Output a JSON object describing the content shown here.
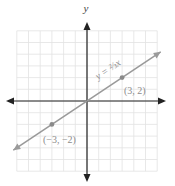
{
  "chart_data": {
    "type": "line",
    "title": "",
    "xlabel": "x",
    "ylabel": "y",
    "xlim": [
      -6,
      6
    ],
    "ylim": [
      -6,
      6
    ],
    "grid": true,
    "series": [
      {
        "name": "y = (2/3)x",
        "equation": "y = 2/3 x",
        "slope": 0.6667,
        "intercept": 0,
        "x": [
          -6,
          6
        ],
        "y": [
          -4,
          4
        ]
      }
    ],
    "points": [
      {
        "x": 3,
        "y": 2,
        "label": "(3, 2)"
      },
      {
        "x": -3,
        "y": -2,
        "label": "(−3, −2)"
      }
    ],
    "annotations": [
      {
        "text": "y = 2/3 x",
        "position": "along line, upper right of origin"
      }
    ]
  },
  "labels": {
    "y_axis": "y",
    "x_axis": "x",
    "equation": "y = ⅔x",
    "point_a": "(3, 2)",
    "point_b": "(−3, −2)"
  },
  "colors": {
    "grid": "#e2e2e2",
    "axis": "#222222",
    "line": "#9a9a9a",
    "point": "#8a8a8a",
    "label": "#8c8c8c"
  }
}
